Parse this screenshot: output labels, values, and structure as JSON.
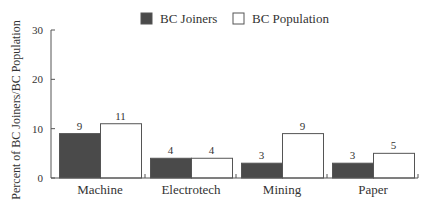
{
  "chart_data": {
    "type": "bar",
    "title": "",
    "xlabel": "",
    "ylabel": "Percent of BC Joiners/BC Population",
    "ylim": [
      0,
      30
    ],
    "yticks": [
      0,
      10,
      20,
      30
    ],
    "grid": false,
    "legend_position": "top",
    "categories": [
      "Machine",
      "Electrotech",
      "Mining",
      "Paper"
    ],
    "series": [
      {
        "name": "BC Joiners",
        "values": [
          9,
          4,
          3,
          3
        ],
        "color": "#4a4a4a"
      },
      {
        "name": "BC Population",
        "values": [
          11,
          4,
          9,
          5
        ],
        "color": "#ffffff"
      }
    ],
    "data_labels": true
  },
  "colors": {
    "axis": "#555555",
    "text": "#333333",
    "joiners_fill": "#4a4a4a",
    "population_fill": "#ffffff",
    "outline": "#555555"
  }
}
